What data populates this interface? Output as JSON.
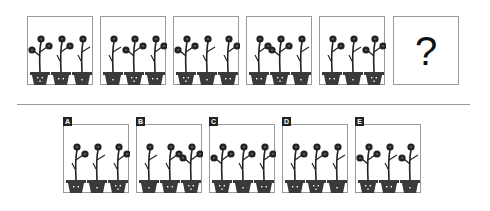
{
  "puzzle": {
    "question_mark": "?",
    "colors": {
      "border": "#9a9a9a",
      "ink": "#222222",
      "pot": "#3a3a3a",
      "background": "#ffffff"
    },
    "sequence": [
      {
        "id": "seq-1",
        "plants": [
          {
            "left": "flower",
            "right": "flower",
            "face": "smile"
          },
          {
            "left": "twig",
            "right": "flower",
            "face": "dots"
          },
          {
            "left": "twig",
            "right": "twig",
            "face": "single"
          }
        ]
      },
      {
        "id": "seq-2",
        "plants": [
          {
            "left": "twig",
            "right": "twig",
            "face": "single"
          },
          {
            "left": "flower",
            "right": "flower",
            "face": "smile"
          },
          {
            "left": "twig",
            "right": "flower",
            "face": "dots"
          }
        ]
      },
      {
        "id": "seq-3",
        "plants": [
          {
            "left": "flower",
            "right": "flower",
            "face": "smile"
          },
          {
            "left": "twig",
            "right": "twig",
            "face": "single"
          },
          {
            "left": "twig",
            "right": "flower",
            "face": "dots"
          }
        ]
      },
      {
        "id": "seq-4",
        "plants": [
          {
            "left": "twig",
            "right": "flower",
            "face": "dots"
          },
          {
            "left": "flower",
            "right": "flower",
            "face": "smile"
          },
          {
            "left": "twig",
            "right": "twig",
            "face": "single"
          }
        ]
      },
      {
        "id": "seq-5",
        "plants": [
          {
            "left": "twig",
            "right": "flower",
            "face": "dots"
          },
          {
            "left": "twig",
            "right": "twig",
            "face": "single"
          },
          {
            "left": "flower",
            "right": "flower",
            "face": "smile"
          }
        ]
      }
    ],
    "options": [
      {
        "label": "A",
        "plants": [
          {
            "left": "twig",
            "right": "flower",
            "face": "dots"
          },
          {
            "left": "twig",
            "right": "twig",
            "face": "single"
          },
          {
            "left": "twig",
            "right": "flower",
            "face": "smile"
          }
        ]
      },
      {
        "label": "B",
        "plants": [
          {
            "left": "twig",
            "right": "twig",
            "face": "single"
          },
          {
            "left": "twig",
            "right": "flower",
            "face": "dots"
          },
          {
            "left": "flower",
            "right": "flower",
            "face": "smile"
          }
        ]
      },
      {
        "label": "C",
        "plants": [
          {
            "left": "flower",
            "right": "flower",
            "face": "smile"
          },
          {
            "left": "twig",
            "right": "flower",
            "face": "single"
          },
          {
            "left": "twig",
            "right": "flower",
            "face": "dots"
          }
        ]
      },
      {
        "label": "D",
        "plants": [
          {
            "left": "twig",
            "right": "flower",
            "face": "dots"
          },
          {
            "left": "twig",
            "right": "flower",
            "face": "smile"
          },
          {
            "left": "twig",
            "right": "twig",
            "face": "single"
          }
        ]
      },
      {
        "label": "E",
        "plants": [
          {
            "left": "flower",
            "right": "flower",
            "face": "smile"
          },
          {
            "left": "twig",
            "right": "twig",
            "face": "dots"
          },
          {
            "left": "flower",
            "right": "twig",
            "face": "single"
          }
        ]
      }
    ]
  }
}
